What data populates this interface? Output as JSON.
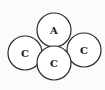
{
  "diagram": {
    "nodes": [
      {
        "id": "top",
        "label": "A",
        "cx": 54,
        "cy": 30,
        "r": 17
      },
      {
        "id": "left",
        "label": "C",
        "cx": 25,
        "cy": 53,
        "r": 17
      },
      {
        "id": "right",
        "label": "C",
        "cx": 84,
        "cy": 50,
        "r": 17
      },
      {
        "id": "bottom",
        "label": "C",
        "cx": 54,
        "cy": 63,
        "r": 17
      }
    ],
    "colors": {
      "stroke": "#2a2a2a",
      "fill": "#ffffff",
      "text": "#1a1a1a",
      "background": "#fbfbfa"
    }
  }
}
